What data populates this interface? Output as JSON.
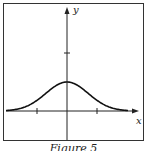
{
  "chart_data": {
    "type": "line",
    "title": "",
    "caption": "Figure 5",
    "xlabel": "x",
    "ylabel": "y",
    "x_ticks": [
      -1,
      1
    ],
    "y_ticks": [
      2
    ],
    "peak": {
      "x": 0,
      "y": 1
    },
    "xlim": [
      -2,
      2
    ],
    "ylim": [
      -0.9,
      3.3
    ],
    "grid": false,
    "legend": null,
    "series": [
      {
        "name": "y = e^{-x^2}",
        "x": [
          -2,
          -1.5,
          -1,
          -0.5,
          0,
          0.5,
          1,
          1.5,
          2
        ],
        "values": [
          0.02,
          0.11,
          0.37,
          0.78,
          1.0,
          0.78,
          0.37,
          0.11,
          0.02
        ]
      }
    ]
  },
  "labels": {
    "x_axis": "x",
    "y_axis": "y",
    "caption": "Figure 5"
  }
}
